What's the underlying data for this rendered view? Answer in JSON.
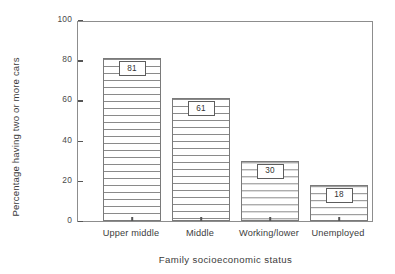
{
  "chart_data": {
    "type": "bar",
    "title": "",
    "xlabel": "Family socioeconomic status",
    "ylabel": "Percentage having two or more cars",
    "categories": [
      "Upper middle",
      "Middle",
      "Working/lower",
      "Unemployed"
    ],
    "values": [
      81,
      61,
      30,
      18
    ],
    "value_labels": [
      "81",
      "61",
      "30",
      "18"
    ],
    "ylim": [
      0,
      100
    ],
    "yticks": [
      0,
      20,
      40,
      60,
      80,
      100
    ],
    "ytick_labels": [
      "0",
      "20",
      "40",
      "60",
      "80",
      "100"
    ],
    "grid": false,
    "legend": null,
    "bar_fill": "white-with-horizontal-hatch",
    "bar_edge_color": "#7a7a7a",
    "frame_color": "#8d8d8d",
    "background": "#ffffff"
  }
}
